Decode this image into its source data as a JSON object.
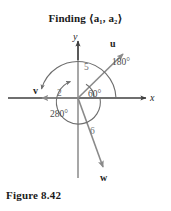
{
  "figure": {
    "title_prefix": "Finding",
    "title_vector": "⟨a₁, a₂⟩",
    "title_full": "Finding ⟨a₁, a₂⟩",
    "caption": "Figure 8.42",
    "colors": {
      "axis": "#4a4a4a",
      "vector": "#8a8a8a",
      "arc": "#6e6e6e",
      "text": "#1f1f1f",
      "background": "#ffffff"
    }
  },
  "axes": {
    "x_label": "x",
    "y_label": "y",
    "origin": {
      "x": 78,
      "y": 98
    }
  },
  "vectors": [
    {
      "name": "u",
      "label": "u",
      "magnitude": "5",
      "angle_label": "60°",
      "direction_deg": 60,
      "tip": {
        "x": 125,
        "y": 52
      }
    },
    {
      "name": "v",
      "label": "v",
      "magnitude": "2",
      "angle_label": "180°",
      "direction_deg": 180,
      "tip": {
        "x": 38,
        "y": 98
      }
    },
    {
      "name": "w",
      "label": "w",
      "magnitude": "6",
      "angle_label": "280°",
      "direction_deg": 280,
      "tip": {
        "x": 104,
        "y": 172
      }
    }
  ],
  "angle_labels": {
    "a60": "60°",
    "a180": "180°",
    "a280": "280°"
  },
  "magnitude_labels": {
    "m5": "5",
    "m2": "2",
    "m6": "6"
  }
}
